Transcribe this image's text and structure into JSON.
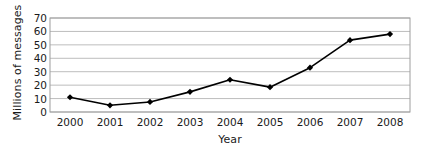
{
  "chart_data": {
    "type": "line",
    "title": "",
    "xlabel": "Year",
    "ylabel": "Millions of messages",
    "categories": [
      "2000",
      "2001",
      "2002",
      "2003",
      "2004",
      "2005",
      "2006",
      "2007",
      "2008"
    ],
    "values": [
      11,
      5,
      7.5,
      15,
      24,
      18.5,
      33,
      53.5,
      58
    ],
    "series": [
      {
        "name": "Millions of messages",
        "values": [
          11,
          5,
          7.5,
          15,
          24,
          18.5,
          33,
          53.5,
          58
        ]
      }
    ],
    "ylim": [
      0,
      70
    ],
    "yticks": [
      0,
      10,
      20,
      30,
      40,
      50,
      60,
      70
    ],
    "ytick_labels": [
      "0",
      "10",
      "20",
      "30",
      "40",
      "50",
      "60",
      "70"
    ],
    "xtick_labels": [
      "2000",
      "2001",
      "2002",
      "2003",
      "2004",
      "2005",
      "2006",
      "2007",
      "2008"
    ],
    "grid": "horizontal",
    "legend": "none",
    "marker": "diamond",
    "line_color": "#000000",
    "marker_color": "#000000",
    "grid_color": "#bdbdbd",
    "frame_color": "#9e9e9e",
    "background_color": "#ffffff"
  }
}
